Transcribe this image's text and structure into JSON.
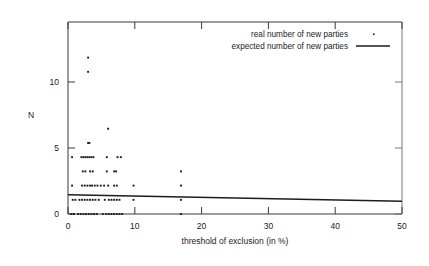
{
  "chart_data": {
    "type": "scatter",
    "title": "",
    "xlabel": "threshold of exclusion (in %)",
    "ylabel": "N",
    "xlim": [
      0,
      50
    ],
    "ylim": [
      0,
      13.5
    ],
    "xticks": [
      0,
      10,
      20,
      30,
      40,
      50
    ],
    "xtick_labels": [
      "0",
      "10",
      "20",
      "30",
      "40",
      "50"
    ],
    "yticks": [
      0,
      5,
      10
    ],
    "ytick_labels": [
      "0",
      "5",
      "10"
    ],
    "grid": false,
    "legend_position": "top-right",
    "series": [
      {
        "name": "real number of new parties",
        "type": "scatter",
        "marker": "point",
        "color": "#1c1c1c",
        "points": [
          [
            3.0,
            11
          ],
          [
            3.0,
            10
          ],
          [
            6.0,
            6
          ],
          [
            3.0,
            5
          ],
          [
            3.2,
            5
          ],
          [
            0.6,
            4
          ],
          [
            2.0,
            4
          ],
          [
            2.3,
            4
          ],
          [
            2.6,
            4
          ],
          [
            2.9,
            4
          ],
          [
            3.2,
            4
          ],
          [
            3.5,
            4
          ],
          [
            3.8,
            4
          ],
          [
            5.8,
            4
          ],
          [
            7.4,
            4
          ],
          [
            7.9,
            4
          ],
          [
            2.2,
            3
          ],
          [
            2.6,
            3
          ],
          [
            3.3,
            3
          ],
          [
            3.7,
            3
          ],
          [
            5.8,
            3
          ],
          [
            6.9,
            3
          ],
          [
            7.2,
            3
          ],
          [
            16.9,
            3
          ],
          [
            0.6,
            2
          ],
          [
            2.1,
            2
          ],
          [
            2.5,
            2
          ],
          [
            2.9,
            2
          ],
          [
            3.3,
            2
          ],
          [
            3.6,
            2
          ],
          [
            4.0,
            2
          ],
          [
            4.4,
            2
          ],
          [
            4.9,
            2
          ],
          [
            5.4,
            2
          ],
          [
            6.0,
            2
          ],
          [
            6.9,
            2
          ],
          [
            7.3,
            2
          ],
          [
            9.8,
            2
          ],
          [
            16.9,
            2
          ],
          [
            0.7,
            1
          ],
          [
            1.1,
            1
          ],
          [
            1.7,
            1
          ],
          [
            2.1,
            1
          ],
          [
            2.5,
            1
          ],
          [
            2.9,
            1
          ],
          [
            3.3,
            1
          ],
          [
            3.7,
            1
          ],
          [
            4.1,
            1
          ],
          [
            4.6,
            1
          ],
          [
            5.5,
            1
          ],
          [
            6.1,
            1
          ],
          [
            6.5,
            1
          ],
          [
            6.9,
            1
          ],
          [
            7.3,
            1
          ],
          [
            7.7,
            1
          ],
          [
            9.8,
            1
          ],
          [
            16.9,
            1
          ],
          [
            0.5,
            0
          ],
          [
            0.9,
            0
          ],
          [
            1.5,
            0
          ],
          [
            1.9,
            0
          ],
          [
            2.3,
            0
          ],
          [
            2.7,
            0
          ],
          [
            3.1,
            0
          ],
          [
            3.5,
            0
          ],
          [
            3.9,
            0
          ],
          [
            4.3,
            0
          ],
          [
            5.2,
            0
          ],
          [
            5.7,
            0
          ],
          [
            6.1,
            0
          ],
          [
            6.5,
            0
          ],
          [
            6.9,
            0
          ],
          [
            7.3,
            0
          ],
          [
            7.7,
            0
          ],
          [
            8.1,
            0
          ],
          [
            16.9,
            0
          ]
        ]
      },
      {
        "name": "expected number of new parties",
        "type": "line",
        "color": "#1c1c1c",
        "x": [
          0,
          50
        ],
        "y": [
          1.35,
          0.9
        ]
      }
    ]
  },
  "legend": {
    "entries": [
      {
        "label": "real number of new parties",
        "marker": "point"
      },
      {
        "label": "expected number of new parties",
        "marker": "line"
      }
    ]
  },
  "axes": {
    "y_axis_label": "N",
    "x_axis_label": "threshold of exclusion (in %)"
  }
}
